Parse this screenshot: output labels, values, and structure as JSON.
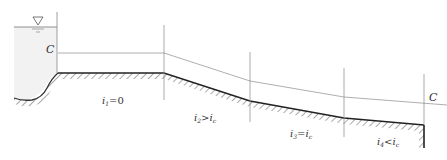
{
  "diagram": {
    "type": "open-channel water surface profile",
    "critical_depth_label": "C",
    "critical_depth_label_right": "C",
    "reservoir": {
      "water_surface_symbol": "▽"
    },
    "reaches": [
      {
        "id": 1,
        "slope_label": "i",
        "subscript": "1",
        "relation": "=0"
      },
      {
        "id": 2,
        "slope_label": "i",
        "subscript": "2",
        "relation": ">",
        "ref": "i",
        "ref_sub": "c"
      },
      {
        "id": 3,
        "slope_label": "i",
        "subscript": "3",
        "relation": "=",
        "ref": "i",
        "ref_sub": "c"
      },
      {
        "id": 4,
        "slope_label": "i",
        "subscript": "4",
        "relation": "<",
        "ref": "i",
        "ref_sub": "c"
      }
    ],
    "colors": {
      "bed": "#222222",
      "hatch": "#555555",
      "line": "#999999",
      "water": "#f2f2f2"
    }
  }
}
